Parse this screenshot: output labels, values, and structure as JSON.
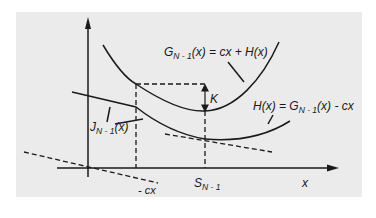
{
  "diagram": {
    "axes": {
      "x_label": "x"
    },
    "labels": {
      "G_main": "G",
      "G_sub": "N - 1",
      "G_rest": "(x) = cx + H(x)",
      "H_main": "H(x) = G",
      "H_sub": "N - 1",
      "H_rest": "(x) - cx",
      "J_main": "J",
      "J_sub": "N - 1",
      "J_rest": "(x)",
      "K": "K",
      "S_main": "S",
      "S_sub": "N - 1",
      "neg_cx": "- cx"
    },
    "colors": {
      "panel": "#ebebeb",
      "ink": "#1a1a1a"
    }
  }
}
